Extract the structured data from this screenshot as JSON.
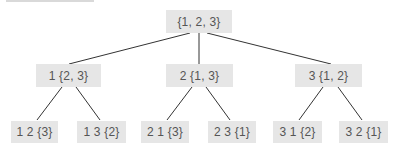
{
  "diagram": {
    "type": "tree",
    "colors": {
      "node_fill": "#e6e6e6",
      "text": "#555555",
      "edge": "#333333"
    },
    "root": {
      "label": "{1, 2, 3}"
    },
    "level1": [
      {
        "label": "1 {2, 3}"
      },
      {
        "label": "2 {1, 3}"
      },
      {
        "label": "3 {1, 2}"
      }
    ],
    "level2": [
      {
        "label": "1 2 {3}",
        "parent": 0
      },
      {
        "label": "1 3 {2}",
        "parent": 0
      },
      {
        "label": "2 1 {3}",
        "parent": 1
      },
      {
        "label": "2 3 {1}",
        "parent": 1
      },
      {
        "label": "3 1 {2}",
        "parent": 2
      },
      {
        "label": "3 2 {1}",
        "parent": 2
      }
    ]
  }
}
